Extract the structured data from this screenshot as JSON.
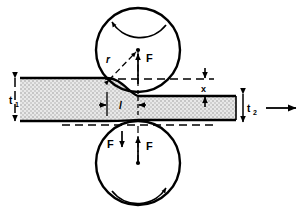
{
  "figure": {
    "type": "engineering-diagram",
    "background": "#ffffff",
    "stroke_color": "#000000",
    "strip_fill": "#d9d9d9"
  },
  "labels": {
    "thickness_in": "t",
    "thickness_in_sub": "1",
    "thickness_out": "t",
    "thickness_out_sub": "2",
    "radius": "r",
    "contact_length": "l",
    "draft_offset": "x",
    "force_roll": "F",
    "force_reaction": "F",
    "force_separating": "F"
  },
  "rolls": {
    "top": {
      "cx": 138,
      "cy": 50,
      "r": 42,
      "rotation": "clockwise",
      "rotation_arrow": "arc-arrow-left"
    },
    "bottom": {
      "cx": 138,
      "cy": 163,
      "r": 42,
      "rotation": "counterclockwise",
      "rotation_arrow": "arc-arrow-left"
    }
  },
  "strip": {
    "entry_top_y": 78,
    "entry_bottom_y": 121,
    "exit_top_y": 96,
    "exit_bottom_y": 120,
    "left_x": 20,
    "right_x": 236,
    "bite_x": 107,
    "neutral_x": 138
  },
  "annotations": {
    "exit_direction_arrow": "arrow-right",
    "dashed_reference_top_y": 79,
    "dashed_reference_bottom_y": 125
  }
}
